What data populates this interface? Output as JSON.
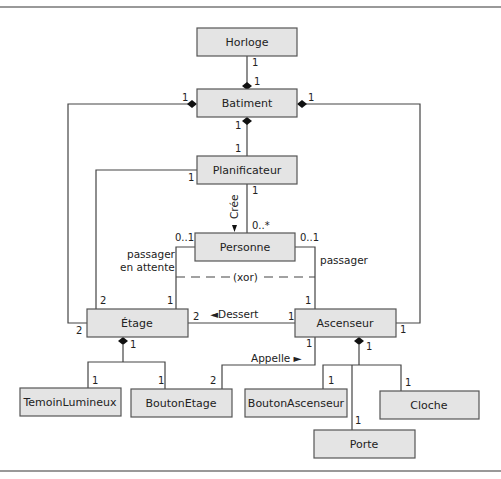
{
  "classes": {
    "horloge": "Horloge",
    "batiment": "Batiment",
    "planificateur": "Planificateur",
    "personne": "Personne",
    "etage": "Étage",
    "ascenseur": "Ascenseur",
    "temoin": "TemoinLumineux",
    "bouton_etage": "BoutonEtage",
    "bouton_ascenseur": "BoutonAscenseur",
    "cloche": "Cloche",
    "porte": "Porte"
  },
  "multiplicities": {
    "horloge_batiment_top": "1",
    "horloge_batiment_bottom": "1",
    "batiment_left": "1",
    "batiment_right": "1",
    "batiment_planif_top": "1",
    "batiment_planif_bottom": "1",
    "planif_etage": "1",
    "planif_personne_top": "1",
    "planif_personne_bottom": "0..*",
    "personne_left": "0..1",
    "personne_right": "0..1",
    "etage_top_left": "2",
    "etage_top_right": "1",
    "etage_left": "2",
    "etage_right": "2",
    "ascenseur_top_left": "1",
    "ascenseur_left": "1",
    "ascenseur_bottom_left": "1",
    "ascenseur_right": "1",
    "etage_comp": "1",
    "temoin": "1",
    "bouton_etage": "1",
    "bouton_etage_appelle": "2",
    "ascenseur_comp": "1",
    "bouton_ascenseur": "1",
    "porte": "1",
    "cloche": "1"
  },
  "labels": {
    "cree": "Crée",
    "passager_attente_1": "passager",
    "passager_attente_2": "en attente",
    "passager": "passager",
    "xor": "(xor)",
    "dessert": "◄Dessert",
    "appelle": "Appelle ►"
  }
}
